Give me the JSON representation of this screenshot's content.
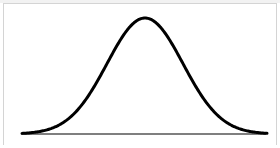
{
  "diagram": {
    "title": "",
    "type": "normal-distribution-bell-curve",
    "curve": {
      "color": "#000000",
      "stroke_width": 3,
      "mean_x": 145,
      "peak_y": 18,
      "baseline_y": 134,
      "sigma_px": 38,
      "x_start": 22,
      "x_end": 267
    },
    "baseline": {
      "color": "#555555",
      "x_start": 23,
      "x_end": 266,
      "y": 134
    },
    "frame_color": "#d4d4d4"
  }
}
